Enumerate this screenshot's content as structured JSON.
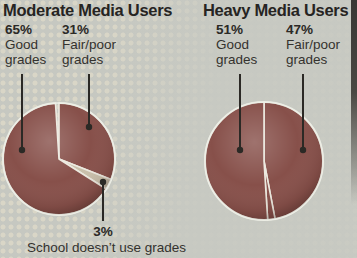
{
  "figure": {
    "kind": "two-pie-comparison",
    "background_color": "#c6c8c1",
    "pie_color": "#87504a",
    "pie_light_color": "#c9c0ab",
    "divider_color": "#ece9df",
    "leader_line_color": "#2b2925",
    "text_color": "#34322e",
    "page_edge_color": "#3b3a37"
  },
  "chart_data": [
    {
      "type": "pie",
      "title": "Moderate Media Users",
      "direction": "clockwise",
      "start_angle_deg": 0,
      "legend": "none",
      "slices": [
        {
          "label": "Fair/poor grades",
          "value": 31,
          "color": "#87504a"
        },
        {
          "label": "School doesn’t use grades",
          "value": 3,
          "color": "#c9c0ab"
        },
        {
          "label": "Good grades",
          "value": 65,
          "color": "#87504a"
        }
      ]
    },
    {
      "type": "pie",
      "title": "Heavy Media Users",
      "direction": "clockwise",
      "start_angle_deg": 0,
      "legend": "none",
      "slices": [
        {
          "label": "Fair/poor grades",
          "value": 47,
          "color": "#87504a"
        },
        {
          "label": "",
          "value": 2,
          "color": "#87504a"
        },
        {
          "label": "Good grades",
          "value": 51,
          "color": "#87504a"
        }
      ]
    }
  ],
  "callouts": [
    {
      "pct": "65%",
      "line1": "Good",
      "line2": "grades"
    },
    {
      "pct": "31%",
      "line1": "Fair/poor",
      "line2": "grades"
    },
    {
      "pct": "51%",
      "line1": "Good",
      "line2": "grades"
    },
    {
      "pct": "47%",
      "line1": "Fair/poor",
      "line2": "grades"
    }
  ],
  "footnote": {
    "pct": "3%",
    "label": "School doesn’t use grades"
  }
}
